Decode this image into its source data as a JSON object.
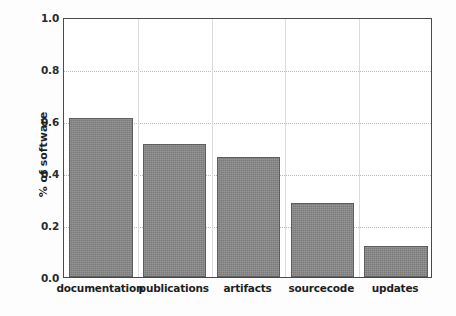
{
  "chart_data": {
    "type": "bar",
    "title": "",
    "xlabel": "",
    "ylabel": "% of software",
    "categories": [
      "documentation",
      "publications",
      "artifacts",
      "sourcecode",
      "updates"
    ],
    "values": [
      0.61,
      0.51,
      0.46,
      0.285,
      0.12
    ],
    "ylim": [
      0.0,
      1.0
    ],
    "xlim": [
      0,
      5
    ],
    "yticks": [
      "0.0",
      "0.2",
      "0.4",
      "0.6",
      "0.8",
      "1.0"
    ],
    "ytick_values": [
      0.0,
      0.2,
      0.4,
      0.6,
      0.8,
      1.0
    ],
    "grid": true,
    "grid_style": "dotted",
    "legend": "none",
    "bar_fill_color": "#878787",
    "bar_edge_color": "#5e5e5e",
    "grid_color": "#b9b9b9",
    "axis_color": "#4a4a4a",
    "background_color": "#ffffff"
  }
}
